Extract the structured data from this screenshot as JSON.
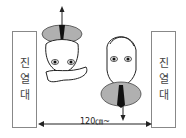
{
  "left_panel": {
    "chars": [
      "진",
      "열",
      "대"
    ]
  },
  "right_panel": {
    "chars": [
      "진",
      "열",
      "대"
    ]
  },
  "dimension": {
    "label": "120㎝~"
  },
  "figures": [
    {
      "name": "person-upside-down",
      "orientation": "head-down",
      "arrow": "up"
    },
    {
      "name": "person-upright",
      "orientation": "head-up",
      "arrow": "down"
    }
  ],
  "colors": {
    "line": "#222222",
    "shirt": "#b0b0b0",
    "panel_border": "#888888"
  }
}
